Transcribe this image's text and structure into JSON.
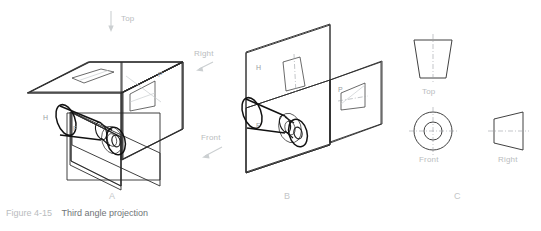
{
  "figure": {
    "number": "Figure 4-15",
    "title": "Third angle projection"
  },
  "direction_labels": {
    "top": "Top",
    "right": "Right",
    "front": "Front"
  },
  "panels": [
    {
      "id": "a",
      "letter": "A"
    },
    {
      "id": "b",
      "letter": "B"
    },
    {
      "id": "c",
      "letter": "C"
    }
  ],
  "panel_a": {
    "plane_labels": [
      "H",
      "F",
      "P"
    ],
    "description": "glass box with three mutually perpendicular projection planes and truncated cone object"
  },
  "panel_b": {
    "plane_labels": {
      "horizontal": "H",
      "frontal": "F",
      "profile": "P"
    },
    "description": "projection planes partially unfolded"
  },
  "panel_c": {
    "views": [
      {
        "name": "top-view",
        "label": "Top",
        "shape": "trapezoid"
      },
      {
        "name": "front-view",
        "label": "Front",
        "shape": "concentric-circles"
      },
      {
        "name": "right-view",
        "label": "Right",
        "shape": "trapezoid"
      }
    ]
  },
  "colors": {
    "background": "#ffffff",
    "line": "#2b2b2b",
    "object_line": "#111111",
    "label": "#b9bcbe",
    "caption_number": "#b9bcbe",
    "caption_text": "#6f7477",
    "centerline": "#9aa0a4"
  }
}
